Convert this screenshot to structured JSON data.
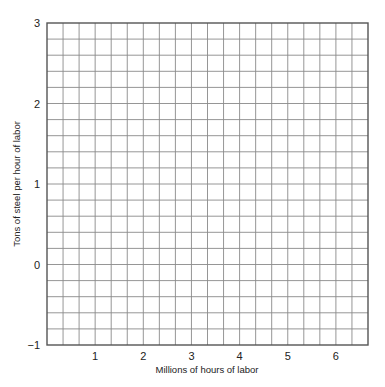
{
  "chart_data": {
    "type": "line",
    "title": "",
    "xlabel": "Millions of hours of labor",
    "ylabel": "Tons of steel per hour of labor",
    "xlim": [
      0,
      6.6667
    ],
    "ylim": [
      -1,
      3
    ],
    "x_ticks": [
      1,
      2,
      3,
      4,
      5,
      6
    ],
    "x_tick_labels": [
      "1",
      "2",
      "3",
      "4",
      "5",
      "6"
    ],
    "y_ticks": [
      3,
      2,
      1,
      0,
      -1
    ],
    "y_tick_labels": [
      "3",
      "2",
      "1",
      "0",
      "−1"
    ],
    "grid": true,
    "grid_minor_x_step": 0.3333,
    "grid_minor_y_step": 0.2,
    "grid_columns": 20,
    "grid_rows": 20,
    "series": [],
    "legend": null
  },
  "colors": {
    "grid": "#8a8a8a",
    "border": "#555555",
    "text": "#222222",
    "background": "#ffffff"
  }
}
